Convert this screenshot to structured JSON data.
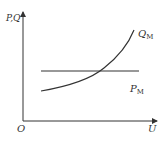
{
  "diagram": {
    "y_axis_label": "P,Q",
    "x_axis_label": "U",
    "origin_label": "O",
    "curves": [
      {
        "name": "Q",
        "subscript": "M",
        "type": "increasing-convex-curve"
      },
      {
        "name": "P",
        "subscript": "M",
        "type": "horizontal-line"
      }
    ],
    "colors": {
      "line": "#333333",
      "background": "#ffffff"
    }
  }
}
